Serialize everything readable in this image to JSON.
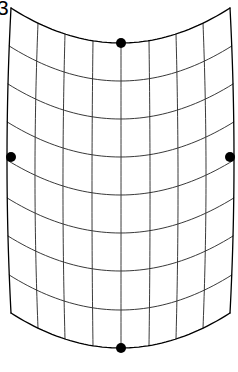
{
  "figure": {
    "corner_label": "3",
    "background_color": "#ffffff",
    "width": 238,
    "height": 372
  },
  "mesh": {
    "line_color": "#222222",
    "boundary_color": "#000000",
    "interior_line_width": 0.9,
    "boundary_line_width": 1.3,
    "columns": 8,
    "rows": 8,
    "u_lines": 9,
    "v_lines": 9,
    "patch": {
      "left_x": 11,
      "right_x": 230,
      "top_y": 8,
      "bottom_y": 313,
      "sag": 35,
      "side_bulge": 4
    },
    "u_positions": [
      11,
      38,
      65,
      93,
      121,
      149,
      176,
      203,
      230
    ],
    "v_positions": [
      8,
      46,
      84,
      122,
      160,
      198,
      236,
      275,
      313
    ]
  },
  "markers": {
    "color": "#000000",
    "radius": 5,
    "points": [
      {
        "name": "top-edge-midpoint",
        "x": 121,
        "y": 43
      },
      {
        "name": "left-edge-midpoint",
        "x": 11,
        "y": 157
      },
      {
        "name": "right-edge-midpoint",
        "x": 230,
        "y": 157
      },
      {
        "name": "bottom-edge-midpoint",
        "x": 121,
        "y": 348
      }
    ]
  }
}
